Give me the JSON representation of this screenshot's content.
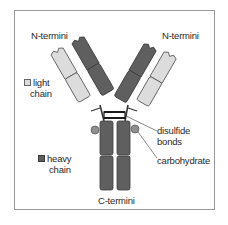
{
  "diagram": {
    "colors": {
      "heavy_chain": "#5f5f5f",
      "light_chain": "#dcdcdc",
      "outline": "#444444",
      "frame": "#9a9a9a",
      "background": "#ffffff",
      "carbohydrate": "#8f8f8f"
    },
    "labels": {
      "n_termini_left": "N-termini",
      "n_termini_right": "N-termini",
      "c_termini": "C-termini",
      "disulfide_line1": "disulfide",
      "disulfide_line2": "bonds",
      "carbohydrate": "carbohydrate"
    },
    "legend": [
      {
        "key": "light",
        "line1": "light",
        "line2": "chain",
        "color": "#dcdcdc"
      },
      {
        "key": "heavy",
        "line1": "heavy",
        "line2": "chain",
        "color": "#5f5f5f"
      }
    ],
    "nodes": [
      {
        "id": "heavy-chain-left",
        "type": "heavy chain"
      },
      {
        "id": "heavy-chain-right",
        "type": "heavy chain"
      },
      {
        "id": "light-chain-left",
        "type": "light chain"
      },
      {
        "id": "light-chain-right",
        "type": "light chain"
      },
      {
        "id": "disulfide-bonds",
        "type": "bonds"
      },
      {
        "id": "carbohydrate-left",
        "type": "carbohydrate"
      },
      {
        "id": "carbohydrate-right",
        "type": "carbohydrate"
      }
    ]
  }
}
